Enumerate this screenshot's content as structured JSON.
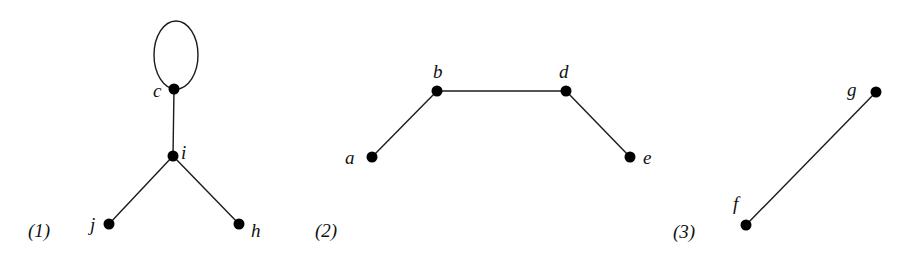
{
  "graphs": [
    {
      "label": "(1)",
      "nodes": [
        {
          "id": "c",
          "label": "c"
        },
        {
          "id": "i",
          "label": "i"
        },
        {
          "id": "j",
          "label": "j"
        },
        {
          "id": "h",
          "label": "h"
        }
      ],
      "edges": [
        [
          "c",
          "c"
        ],
        [
          "c",
          "i"
        ],
        [
          "i",
          "j"
        ],
        [
          "i",
          "h"
        ]
      ]
    },
    {
      "label": "(2)",
      "nodes": [
        {
          "id": "a",
          "label": "a"
        },
        {
          "id": "b",
          "label": "b"
        },
        {
          "id": "d",
          "label": "d"
        },
        {
          "id": "e",
          "label": "e"
        }
      ],
      "edges": [
        [
          "a",
          "b"
        ],
        [
          "b",
          "d"
        ],
        [
          "d",
          "e"
        ]
      ]
    },
    {
      "label": "(3)",
      "nodes": [
        {
          "id": "f",
          "label": "f"
        },
        {
          "id": "g",
          "label": "g"
        }
      ],
      "edges": [
        [
          "f",
          "g"
        ]
      ]
    }
  ]
}
